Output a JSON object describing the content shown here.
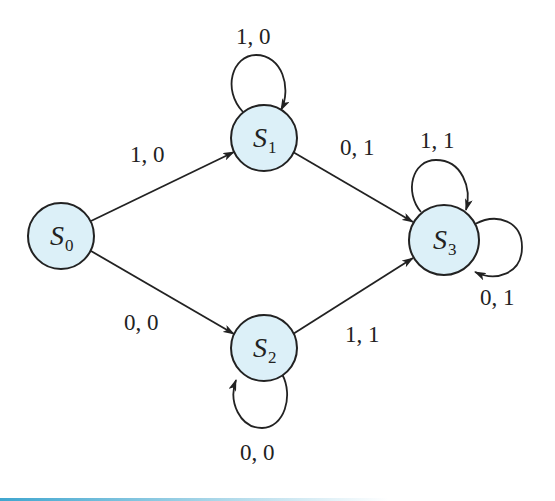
{
  "diagram": {
    "type": "finite-state-machine",
    "fill_color": "#dcf0f8",
    "stroke_color": "#222222",
    "states": [
      {
        "id": "S0",
        "symbol": "S",
        "subscript": "0",
        "cx": 61,
        "cy": 236,
        "r": 33
      },
      {
        "id": "S1",
        "symbol": "S",
        "subscript": "1",
        "cx": 264,
        "cy": 138,
        "r": 33
      },
      {
        "id": "S2",
        "symbol": "S",
        "subscript": "2",
        "cx": 264,
        "cy": 348,
        "r": 33
      },
      {
        "id": "S3",
        "symbol": "S",
        "subscript": "3",
        "cx": 444,
        "cy": 240,
        "r": 35
      }
    ],
    "transitions": [
      {
        "from": "S0",
        "to": "S1",
        "label": "1, 0"
      },
      {
        "from": "S0",
        "to": "S2",
        "label": "0, 0"
      },
      {
        "from": "S1",
        "to": "S1",
        "label": "1, 0"
      },
      {
        "from": "S1",
        "to": "S3",
        "label": "0, 1"
      },
      {
        "from": "S2",
        "to": "S2",
        "label": "0, 0"
      },
      {
        "from": "S2",
        "to": "S3",
        "label": "1, 1"
      },
      {
        "from": "S3",
        "to": "S3",
        "label": "1, 1"
      },
      {
        "from": "S3",
        "to": "S3",
        "label": "0, 1"
      }
    ]
  },
  "labels": {
    "s0_s1": "1, 0",
    "s0_s2": "0, 0",
    "s1_loop": "1, 0",
    "s1_s3": "0, 1",
    "s2_loop": "0, 0",
    "s2_s3": "1, 1",
    "s3_loop_top": "1, 1",
    "s3_loop_right": "0, 1"
  },
  "states": {
    "s0": {
      "symbol": "S",
      "sub": "0"
    },
    "s1": {
      "symbol": "S",
      "sub": "1"
    },
    "s2": {
      "symbol": "S",
      "sub": "2"
    },
    "s3": {
      "symbol": "S",
      "sub": "3"
    }
  }
}
